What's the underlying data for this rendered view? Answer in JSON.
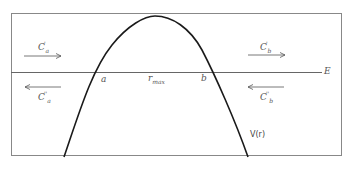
{
  "diagram": {
    "energy_label": "E",
    "curve_label": "V(r)",
    "turning_points": {
      "left": "a",
      "right": "b"
    },
    "peak_label": {
      "base": "r",
      "sub": "max"
    },
    "waves": {
      "left_incoming": {
        "base": "C",
        "sub": "a",
        "sup": "'",
        "direction": "right"
      },
      "left_outgoing": {
        "base": "C",
        "sub": "a",
        "sup": "''",
        "direction": "left"
      },
      "right_incoming": {
        "base": "C",
        "sub": "b",
        "sup": "'",
        "direction": "right"
      },
      "right_outgoing": {
        "base": "C",
        "sub": "b",
        "sup": "''",
        "direction": "left"
      }
    },
    "colors": {
      "line": "#222222",
      "frame": "#777777",
      "text": "#555555"
    }
  }
}
